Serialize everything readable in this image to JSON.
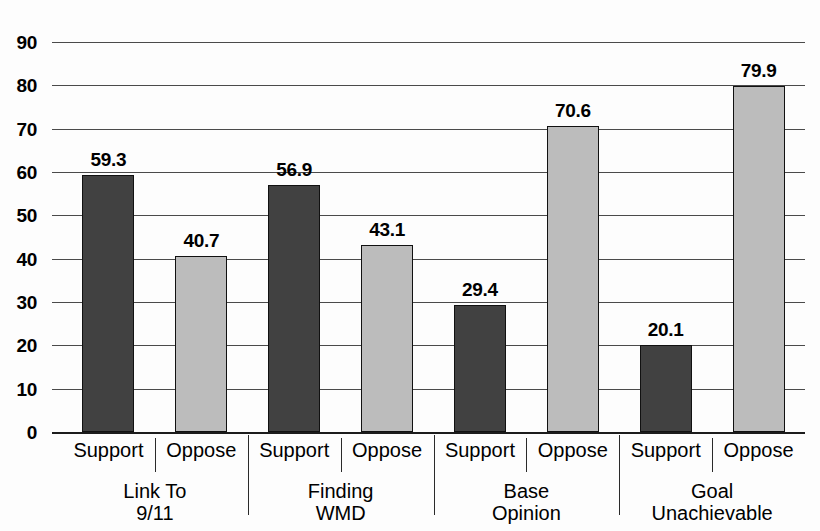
{
  "chart_data": {
    "type": "bar",
    "title": "",
    "subtitle": "",
    "xlabel": "",
    "ylabel": "",
    "ylim": [
      0,
      90
    ],
    "y_ticks": [
      0,
      10,
      20,
      30,
      40,
      50,
      60,
      70,
      80,
      90
    ],
    "grid": true,
    "legend": "none",
    "categories": [
      "Link To 9/11",
      "Finding WMD",
      "Base Opinion",
      "Goal Unachievable"
    ],
    "series": [
      {
        "name": "Support",
        "values": [
          59.3,
          56.9,
          29.4,
          20.1
        ],
        "color": "#414141"
      },
      {
        "name": "Oppose",
        "values": [
          40.7,
          43.1,
          70.6,
          79.9
        ],
        "color": "#bcbcbc"
      }
    ],
    "bars": [
      {
        "group": 0,
        "series": "Support",
        "label": "Support",
        "value": 59.3,
        "value_label": "59.3",
        "style": "support"
      },
      {
        "group": 0,
        "series": "Oppose",
        "label": "Oppose",
        "value": 40.7,
        "value_label": "40.7",
        "style": "oppose"
      },
      {
        "group": 1,
        "series": "Support",
        "label": "Support",
        "value": 56.9,
        "value_label": "56.9",
        "style": "support"
      },
      {
        "group": 1,
        "series": "Oppose",
        "label": "Oppose",
        "value": 43.1,
        "value_label": "43.1",
        "style": "oppose"
      },
      {
        "group": 2,
        "series": "Support",
        "label": "Support",
        "value": 29.4,
        "value_label": "29.4",
        "style": "support"
      },
      {
        "group": 2,
        "series": "Oppose",
        "label": "Oppose",
        "value": 70.6,
        "value_label": "70.6",
        "style": "oppose"
      },
      {
        "group": 3,
        "series": "Support",
        "label": "Support",
        "value": 20.1,
        "value_label": "20.1",
        "style": "support"
      },
      {
        "group": 3,
        "series": "Oppose",
        "label": "Oppose",
        "value": 79.9,
        "value_label": "79.9",
        "style": "oppose"
      }
    ],
    "groups": [
      {
        "line1": "Link To",
        "line2": "9/11"
      },
      {
        "line1": "Finding",
        "line2": "WMD"
      },
      {
        "line1": "Base",
        "line2": "Opinion"
      },
      {
        "line1": "Goal",
        "line2": "Unachievable"
      }
    ]
  },
  "axis": {
    "y_tick_labels": [
      "90",
      "80",
      "70",
      "60",
      "50",
      "40",
      "30",
      "20",
      "10",
      "0"
    ]
  },
  "colors": {
    "support_bar": "#414141",
    "oppose_bar": "#bcbcbc",
    "gridline": "#4a4a4a",
    "axis": "#1c1c1c",
    "text": "#000000",
    "background": "#fdfdfd"
  }
}
